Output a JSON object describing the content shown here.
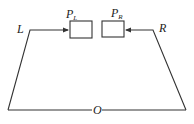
{
  "diagram": {
    "nodes": {
      "L": {
        "label": "L"
      },
      "R": {
        "label": "R"
      },
      "O": {
        "label": "O"
      },
      "PL": {
        "label": "P",
        "subscript": "L"
      },
      "PR": {
        "label": "P",
        "subscript": "R"
      }
    },
    "edges": [
      {
        "from": "O",
        "to": "L",
        "style": "line"
      },
      {
        "from": "L",
        "to": "PL",
        "style": "arrow"
      },
      {
        "from": "O",
        "to": "R",
        "style": "line"
      },
      {
        "from": "R",
        "to": "PR",
        "style": "arrow"
      }
    ],
    "stroke_color": "#333333"
  }
}
